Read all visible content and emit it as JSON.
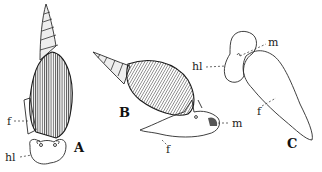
{
  "figure": {
    "panels": [
      {
        "id": "A",
        "caption": "A",
        "description": "snail, dorsal view with elongate spire shell",
        "labels": [
          {
            "text": "f",
            "meaning": "foot"
          },
          {
            "text": "hl",
            "meaning": "head lobe"
          }
        ]
      },
      {
        "id": "B",
        "caption": "B",
        "description": "snail, lateral view crawling",
        "labels": [
          {
            "text": "f",
            "meaning": "foot"
          },
          {
            "text": "m",
            "meaning": "mouth"
          }
        ]
      },
      {
        "id": "C",
        "caption": "C",
        "description": "animal removed from shell, outline",
        "labels": [
          {
            "text": "hl",
            "meaning": "head lobe"
          },
          {
            "text": "m",
            "meaning": "mouth"
          },
          {
            "text": "f",
            "meaning": "foot"
          }
        ]
      }
    ]
  }
}
